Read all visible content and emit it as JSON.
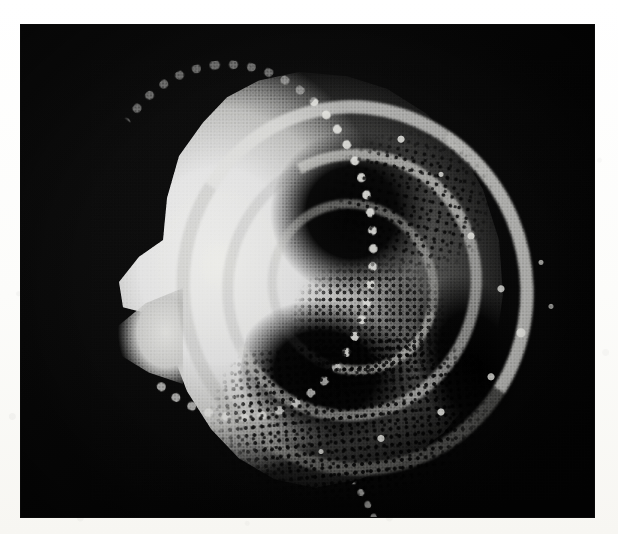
{
  "plate": {
    "kind": "sem-micrograph",
    "subject": "microfossil test (foraminifera-like shell)",
    "background_color": "#050505",
    "margin_color": "#fdfdfb",
    "alt_text": "Scanning electron micrograph of a coiled microfossil test on a black background, showing a bright granular outer wall on the left, deeply shadowed chambers in the centre, a beaded nodular keel arc along the right margin and a finely punctate pore field across the lower half."
  },
  "specimen": {
    "label": "",
    "features": [
      {
        "name": "bright-granular-wall",
        "position": "left",
        "tone": "#e9e9e6"
      },
      {
        "name": "left-spine",
        "position": "left-margin",
        "tone": "#ebebe8"
      },
      {
        "name": "umbilical-shadow",
        "position": "upper-centre",
        "tone": "#000000"
      },
      {
        "name": "spiral-ridge-outer",
        "position": "centre",
        "tone": "#e2e2de"
      },
      {
        "name": "spiral-ridge-mid",
        "position": "centre",
        "tone": "#d8d8d4"
      },
      {
        "name": "spiral-ridge-inner",
        "position": "centre",
        "tone": "#cecece"
      },
      {
        "name": "beaded-keel-arc",
        "position": "right",
        "tone": "#eeeeea"
      },
      {
        "name": "serrated-ventral-margin",
        "position": "lower-left",
        "tone": "#ebebe7"
      },
      {
        "name": "punctate-pore-field",
        "position": "lower",
        "tone": "#000000"
      }
    ]
  },
  "colors": {
    "plate_black": "#050505",
    "paper_white": "#fdfdfb",
    "highlight": "#ededea",
    "midtone": "#b8b8b6",
    "shadow": "#000000"
  },
  "geometry": {
    "image_width": 618,
    "image_height": 534,
    "plate_left": 21,
    "plate_top": 25,
    "plate_width": 573,
    "plate_height": 492
  }
}
